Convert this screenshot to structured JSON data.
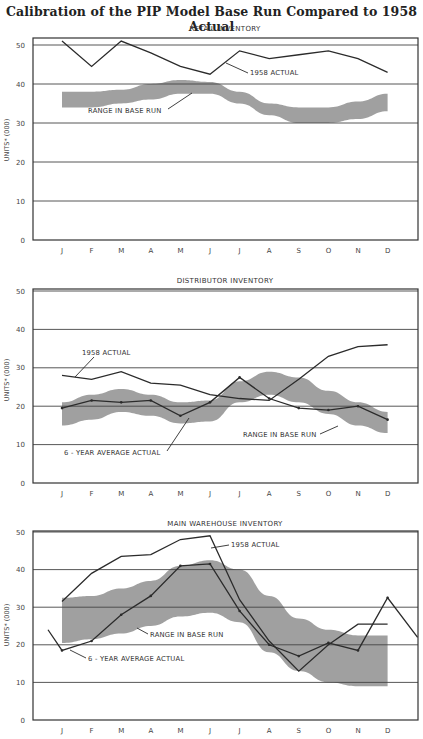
{
  "title": "Calibration of the PIP Model Base Run Compared to 1958 Actual",
  "months": [
    "J",
    "F",
    "M",
    "A",
    "M",
    "J",
    "J",
    "A",
    "S",
    "O",
    "N",
    "D"
  ],
  "y_axis_label": "UNITS* (000)",
  "y_ticks": [
    "0",
    "10",
    "20",
    "30",
    "40",
    "50"
  ],
  "chart_data": [
    {
      "type": "line",
      "title": "RETAIL INVENTORY",
      "xlabel": "",
      "ylabel": "UNITS* (000)",
      "ylim": [
        0,
        50
      ],
      "grid": true,
      "categories": [
        "J",
        "F",
        "M",
        "A",
        "M",
        "J",
        "J",
        "A",
        "S",
        "O",
        "N",
        "D"
      ],
      "series": [
        {
          "name": "1958 ACTUAL",
          "values": [
            51,
            44.5,
            51,
            48,
            44.5,
            42.5,
            48.5,
            46.5,
            47.5,
            48.5,
            46.5,
            43
          ]
        }
      ],
      "bands": [
        {
          "name": "RANGE IN BASE RUN",
          "lower": [
            34,
            34,
            35,
            36,
            37.5,
            37.5,
            35,
            32,
            30,
            30,
            31,
            33
          ],
          "upper": [
            38,
            38,
            38.5,
            40,
            41,
            40.5,
            38,
            35,
            34,
            34,
            35.5,
            37.5
          ]
        }
      ],
      "annotations": [
        "1958 ACTUAL",
        "RANGE IN BASE RUN"
      ]
    },
    {
      "type": "line",
      "title": "DISTRIBUTOR INVENTORY",
      "xlabel": "",
      "ylabel": "UNITS* (000)",
      "ylim": [
        0,
        50
      ],
      "grid": true,
      "categories": [
        "J",
        "F",
        "M",
        "A",
        "M",
        "J",
        "J",
        "A",
        "S",
        "O",
        "N",
        "D"
      ],
      "series": [
        {
          "name": "1958 ACTUAL",
          "values": [
            28,
            27,
            29,
            26,
            25.5,
            23,
            22,
            21.5,
            27,
            33,
            35.5,
            36
          ]
        },
        {
          "name": "6 - YEAR AVERAGE ACTUAL",
          "values": [
            19.5,
            21.5,
            21,
            21.5,
            17.5,
            21,
            27.5,
            22,
            19.5,
            19,
            20,
            16.5
          ]
        }
      ],
      "bands": [
        {
          "name": "RANGE IN BASE RUN",
          "lower": [
            15,
            16.5,
            18.5,
            17.5,
            15.5,
            16,
            21,
            23,
            21,
            18,
            15,
            13
          ],
          "upper": [
            21,
            23,
            24.5,
            23,
            21,
            21.5,
            26.5,
            29,
            27.5,
            24,
            21,
            18.5
          ]
        }
      ],
      "annotations": [
        "1958 ACTUAL",
        "6 - YEAR AVERAGE ACTUAL",
        "RANGE IN BASE RUN"
      ]
    },
    {
      "type": "line",
      "title": "MAIN WAREHOUSE INVENTORY",
      "xlabel": "",
      "ylabel": "UNITS* (000)",
      "ylim": [
        0,
        50
      ],
      "grid": true,
      "categories": [
        "J",
        "F",
        "M",
        "A",
        "M",
        "J",
        "J",
        "A",
        "S",
        "O",
        "N",
        "D"
      ],
      "series": [
        {
          "name": "1958 ACTUAL",
          "values": [
            31.5,
            39,
            43.5,
            44,
            48,
            49,
            32,
            21,
            13,
            20,
            25.5,
            25.5
          ]
        },
        {
          "name": "6 - YEAR AVERAGE ACTUAL",
          "values": [
            18.5,
            21,
            28,
            33,
            41,
            41.5,
            29,
            20,
            17,
            20.5,
            18.5,
            32.5
          ]
        }
      ],
      "extra_points": {
        "series": "6 - YEAR AVERAGE ACTUAL",
        "before_J": 24,
        "after_D": 22
      },
      "bands": [
        {
          "name": "RANGE IN BASE RUN",
          "lower": [
            20.5,
            21.5,
            23,
            25,
            27.5,
            28.5,
            26,
            18,
            13,
            10,
            9,
            9
          ],
          "upper": [
            32.5,
            33,
            35,
            37,
            41,
            42.5,
            40,
            33,
            27,
            24,
            22.5,
            22.5
          ]
        }
      ],
      "annotations": [
        "1958 ACTUAL",
        "6 - YEAR AVERAGE ACTUAL",
        "RANGE IN BASE RUN"
      ]
    }
  ]
}
